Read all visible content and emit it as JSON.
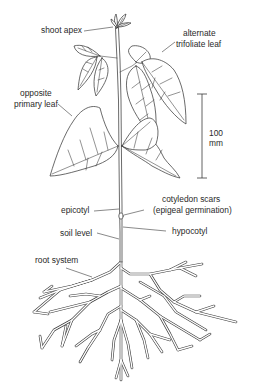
{
  "diagram": {
    "labels": {
      "shoot_apex": "shoot apex",
      "alternate_trifoliate_leaf_1": "alternate",
      "alternate_trifoliate_leaf_2": "trifoliate leaf",
      "opposite_primary_leaf_1": "opposite",
      "opposite_primary_leaf_2": "primary leaf",
      "scale_value": "100",
      "scale_unit": "mm",
      "cotyledon_scars_1": "cotyledon scars",
      "cotyledon_scars_2": "(epigeal germination)",
      "epicotyl": "epicotyl",
      "soil_level": "soil level",
      "hypocotyl": "hypocotyl",
      "root_system": "root system"
    },
    "scale_bar": {
      "length_mm": 100
    },
    "colors": {
      "line": "#3a3a3a",
      "text": "#2a2a2a",
      "background": "#ffffff"
    }
  }
}
